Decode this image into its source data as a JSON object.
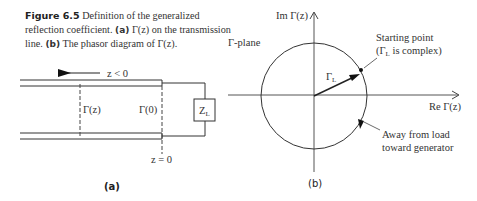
{
  "caption": {
    "figure_label": "Figure 6.5",
    "text_1": " Definition of the generalized reflection coefficient. ",
    "part_a_label": "(a)",
    "text_2": " Γ(z) on the transmission line. ",
    "part_b_label": "(b)",
    "text_3": " The phasor diagram of Γ(z)."
  },
  "panel_a": {
    "direction_label": "z < 0",
    "gamma_z_label": "Γ(z)",
    "gamma_0_label": "Γ(0)",
    "load_label": "Z",
    "load_subscript": "L",
    "origin_label": "z = 0",
    "sublabel": "(a)"
  },
  "panel_b": {
    "plane_label": "Γ-plane",
    "im_axis_label": "Im Γ(z)",
    "re_axis_label": "Re Γ(z)",
    "phasor_label": "Γ",
    "phasor_subscript": "L",
    "start_annotation_line1": "Starting point",
    "start_annotation_line2": "(Γ",
    "start_annotation_sub": "L",
    "start_annotation_line2b": " is complex)",
    "direction_annotation_line1": "Away from load",
    "direction_annotation_line2": "toward generator",
    "sublabel": "(b)"
  }
}
